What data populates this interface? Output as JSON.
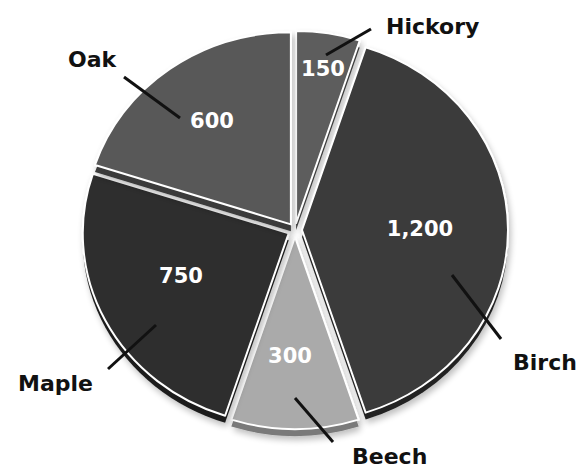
{
  "chart_data": {
    "type": "pie",
    "title": "",
    "start_angle_deg": 0,
    "direction": "clockwise",
    "total": 3000,
    "slices": [
      {
        "label": "Hickory",
        "value": 150,
        "value_label": "150",
        "color": "#5d5d5d",
        "side_color": "#3e3e3e"
      },
      {
        "label": "Birch",
        "value": 1200,
        "value_label": "1,200",
        "color": "#3a3a3a",
        "side_color": "#222222"
      },
      {
        "label": "Beech",
        "value": 300,
        "value_label": "300",
        "color": "#aaaaaa",
        "side_color": "#7a7a7a"
      },
      {
        "label": "Maple",
        "value": 750,
        "value_label": "750",
        "color": "#2f2f2f",
        "side_color": "#1c1c1c"
      },
      {
        "label": "Oak",
        "value": 600,
        "value_label": "600",
        "color": "#595959",
        "side_color": "#3a3a3a"
      }
    ],
    "exploded": true,
    "legend": "none",
    "data_labels": "values inside slices, category names outside with leader lines"
  },
  "layout": {
    "center": [
      295,
      230
    ],
    "rx": 206,
    "ry": 192,
    "explode": 7,
    "depth": 7,
    "value_positions": [
      [
        323,
        76
      ],
      [
        420,
        236
      ],
      [
        290,
        363
      ],
      [
        181,
        283
      ],
      [
        212,
        128
      ]
    ],
    "category_positions": [
      [
        386,
        34
      ],
      [
        513,
        370
      ],
      [
        352,
        464
      ],
      [
        18,
        391
      ],
      [
        68,
        67
      ]
    ],
    "leaders": [
      [
        [
          326,
          55
        ],
        [
          371,
          29
        ]
      ],
      [
        [
          452,
          275
        ],
        [
          501,
          339
        ]
      ],
      [
        [
          295,
          398
        ],
        [
          333,
          442
        ]
      ],
      [
        [
          156,
          325
        ],
        [
          108,
          369
        ]
      ],
      [
        [
          124,
          77
        ],
        [
          180,
          118
        ]
      ]
    ]
  }
}
